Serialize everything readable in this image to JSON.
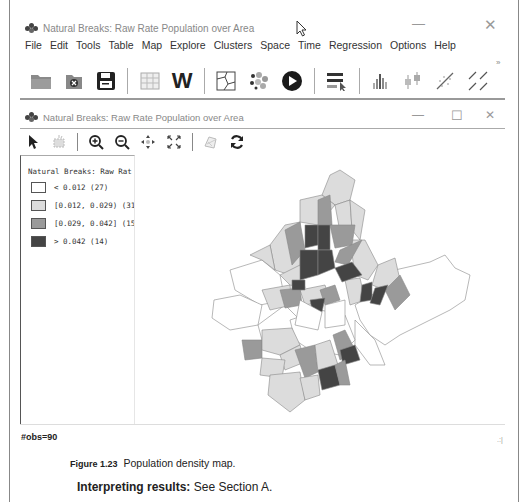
{
  "main_window": {
    "title": "Natural Breaks: Raw Rate Population over Area",
    "minimize": "—",
    "close": "✕"
  },
  "menu": [
    "File",
    "Edit",
    "Tools",
    "Table",
    "Map",
    "Explore",
    "Clusters",
    "Space",
    "Time",
    "Regression",
    "Options",
    "Help"
  ],
  "toolbar": {
    "icons": [
      "open-folder-icon",
      "close-datasource-icon",
      "save-icon",
      "table-icon",
      "weights-icon",
      "map-icon",
      "clusters-icon",
      "play-icon",
      "selection-icon",
      "histogram-icon",
      "boxplot-icon",
      "scatterplot-icon",
      "scatterplot-matrix-icon"
    ],
    "weights_label": "W",
    "overflow": "»"
  },
  "child_window": {
    "title": "Natural Breaks: Raw Rate Population over Area",
    "minimize": "—",
    "maximize": "☐",
    "close": "✕",
    "toolbar_icons": [
      "select-pointer-icon",
      "select-by-rect-icon",
      "zoom-in-icon",
      "zoom-out-icon",
      "pan-icon",
      "fit-extent-icon",
      "adjust-icon",
      "refresh-icon"
    ]
  },
  "legend": {
    "title": "Natural Breaks: Raw Rat",
    "items": [
      {
        "label": "< 0.012 (27)",
        "color": "#ffffff"
      },
      {
        "label": "[0.012, 0.029) (31",
        "color": "#dcdcdc"
      },
      {
        "label": "[0.029, 0.042] (15",
        "color": "#9a9a9a"
      },
      {
        "label": "> 0.042 (14)",
        "color": "#444444"
      }
    ]
  },
  "status": {
    "obs": "#obs=90",
    "grip": ".:|"
  },
  "caption": {
    "figure_label": "Figure 1.23",
    "figure_text": "Population density map."
  },
  "interpreting": {
    "label": "Interpreting results:",
    "text": "See Section A."
  }
}
